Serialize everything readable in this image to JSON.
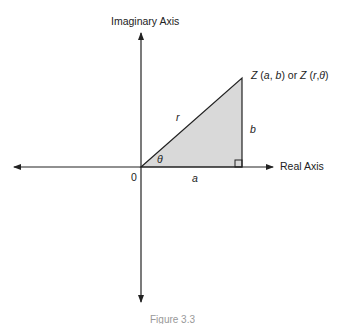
{
  "diagram": {
    "y_axis_label": "Imaginary Axis",
    "x_axis_label": "Real Axis",
    "point_label": "Z (a, b) or Z (r,θ)",
    "origin_label": "0",
    "hypotenuse_label": "r",
    "opposite_label": "b",
    "adjacent_label": "a",
    "angle_label": "θ",
    "caption": "Figure 3.3",
    "fill_color": "#d9d9d9",
    "line_color": "#222222"
  }
}
